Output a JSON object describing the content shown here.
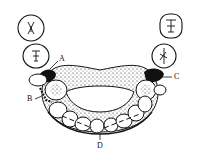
{
  "diagram": {
    "type": "dental-partial-denture",
    "labels": [
      {
        "id": "A",
        "text": "A"
      },
      {
        "id": "B",
        "text": "B"
      },
      {
        "id": "C",
        "text": "C"
      },
      {
        "id": "D",
        "text": "D"
      }
    ],
    "colors": {
      "ink": "#111111",
      "background": "#ffffff"
    }
  }
}
